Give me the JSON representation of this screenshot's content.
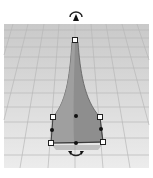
{
  "viewport": {
    "type": "3d-workplane",
    "background": "#ffffff",
    "grid_color": "#bdbdbd",
    "plane_color": "#d6d6d6"
  },
  "shape": {
    "kind": "tapered-spire",
    "fill": "#8e8e8e",
    "fill_light": "#a9a9a9",
    "outline": "#555555",
    "selected": true
  },
  "handles": {
    "corner_handles": 5,
    "midpoint_handles": 4,
    "handle_fill": "#ffffff",
    "handle_stroke": "#222222",
    "midpoint_color": "#111111"
  },
  "controls": {
    "top_rotate_arrow": "rotate-vertical-icon",
    "bottom_rotate_arrow": "rotate-horizontal-icon",
    "lift_cone": "lift-cone-icon"
  }
}
